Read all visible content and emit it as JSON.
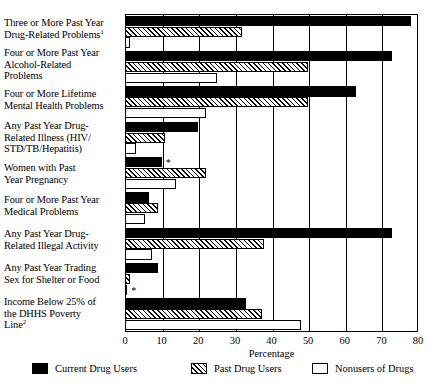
{
  "chart_data": {
    "type": "bar",
    "orientation": "horizontal",
    "title": "",
    "xlabel": "Percentage",
    "ylabel": "",
    "xlim": [
      0,
      80
    ],
    "xticks": [
      0,
      10,
      20,
      30,
      40,
      50,
      60,
      70,
      80
    ],
    "xtick_labels": [
      "0",
      "10",
      "20",
      "30",
      "40",
      "50",
      "60",
      "70",
      "80"
    ],
    "grid": true,
    "legend_position": "bottom",
    "categories": [
      "Three or More Past Year Drug-Related Problems",
      "Four or More Past Year Alcohol-Related Problems",
      "Four or More Lifetime Mental Health Problems",
      "Any Past Year Drug-Related Illness (HIV/STD/TB/Hepatitis)",
      "Women with Past Year Pregnancy",
      "Four or More Past Year Medical Problems",
      "Any Past Year Drug-Related Illegal Activity",
      "Any Past Year Trading Sex for Shelter or Food",
      "Income Below 25% of the DHHS Poverty Line"
    ],
    "series": [
      {
        "name": "Current Drug Users",
        "pattern": "solid-black",
        "values": [
          78,
          73,
          63,
          20,
          10,
          6.5,
          73,
          9,
          33
        ]
      },
      {
        "name": "Past Drug Users",
        "pattern": "diagonal-hatch",
        "values": [
          32,
          50,
          50,
          11,
          22,
          9,
          38,
          1.5,
          37.5
        ]
      },
      {
        "name": "Nonusers of Drugs",
        "pattern": "white-open",
        "values": [
          1.5,
          25,
          22,
          3,
          14,
          5.5,
          7.5,
          0.5,
          48
        ]
      }
    ],
    "annotations": [
      {
        "label": "*",
        "category_index": 4,
        "series_index": 0,
        "note": "asterisk next to Current Drug Users bar for Women with Past Year Pregnancy"
      },
      {
        "label": "*",
        "category_index": 7,
        "series_index": 2,
        "note": "asterisk next to Nonusers of Drugs bar for Any Past Year Trading Sex for Shelter or Food"
      }
    ]
  },
  "axis": {
    "x_title": "Percentage",
    "ticks": [
      "0",
      "10",
      "20",
      "30",
      "40",
      "50",
      "60",
      "70",
      "80"
    ]
  },
  "categories": [
    {
      "line1": "Three or More Past Year",
      "line2": "Drug-Related Problems",
      "footnote": "1",
      "line3": ""
    },
    {
      "line1": "Four or More Past Year",
      "line2": "Alcohol-Related",
      "footnote": "",
      "line3": "Problems"
    },
    {
      "line1": "Four or More Lifetime",
      "line2": "Mental Health Problems",
      "footnote": "",
      "line3": ""
    },
    {
      "line1": "Any Past Year Drug-",
      "line2": "Related Illness (HIV/",
      "footnote": "",
      "line3": "STD/TB/Hepatitis)"
    },
    {
      "line1": "Women with Past",
      "line2": "Year Pregnancy",
      "footnote": "",
      "line3": ""
    },
    {
      "line1": "Four or More Past Year",
      "line2": "Medical Problems",
      "footnote": "",
      "line3": ""
    },
    {
      "line1": "Any Past Year Drug-",
      "line2": "Related Illegal Activity",
      "footnote": "",
      "line3": ""
    },
    {
      "line1": "Any Past Year Trading",
      "line2": "Sex for Shelter or Food",
      "footnote": "",
      "line3": ""
    },
    {
      "line1": "Income Below 25% of",
      "line2": "the DHHS Poverty",
      "footnote": "2",
      "line3": "Line"
    }
  ],
  "legend": {
    "items": [
      {
        "label": "Current Drug Users",
        "pattern": "solid-black"
      },
      {
        "label": "Past Drug Users",
        "pattern": "diagonal-hatch"
      },
      {
        "label": "Nonusers of Drugs",
        "pattern": "white-open"
      }
    ]
  },
  "annotation_marks": {
    "star": "*"
  }
}
